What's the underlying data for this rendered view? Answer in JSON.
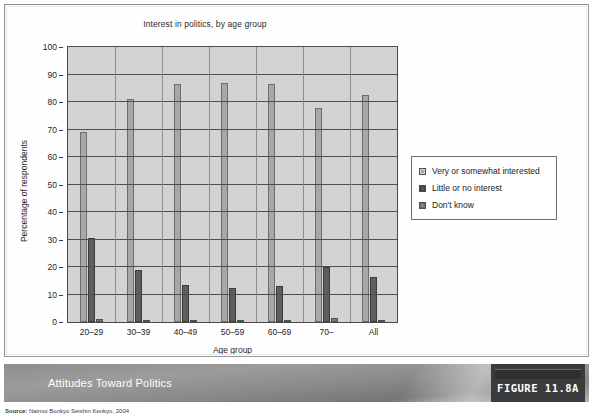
{
  "figure": {
    "caption": "Attitudes Toward Politics",
    "tag": "FIGURE 11.8A",
    "source_prefix": "Source:",
    "source_text": "Naimoi Bonkyo Seishin Kenkyo, 2004"
  },
  "chart_data": {
    "type": "bar",
    "title": "Interest in politics, by age group",
    "xlabel": "Age group",
    "ylabel": "Percentage of respondents",
    "ylim": [
      0,
      100
    ],
    "ytick_step": 10,
    "yticks": [
      0,
      10,
      20,
      30,
      40,
      50,
      60,
      70,
      80,
      90,
      100
    ],
    "grid": true,
    "legend_position": "right",
    "categories": [
      "20–29",
      "30–39",
      "40–49",
      "50–59",
      "60–69",
      "70–",
      "All"
    ],
    "series": [
      {
        "name": "Very or somewhat interested",
        "color": "#a8a8a8",
        "values": [
          69,
          81,
          86.5,
          87,
          86.5,
          78,
          82.5
        ]
      },
      {
        "name": "Little or no interest",
        "color": "#5e5e5e",
        "values": [
          30.5,
          19,
          13.5,
          12.5,
          13,
          20,
          16.5
        ]
      },
      {
        "name": "Don't know",
        "color": "#7d7d7d",
        "values": [
          1.2,
          0.3,
          0.3,
          0.6,
          0.6,
          1.5,
          0.5
        ]
      }
    ]
  }
}
